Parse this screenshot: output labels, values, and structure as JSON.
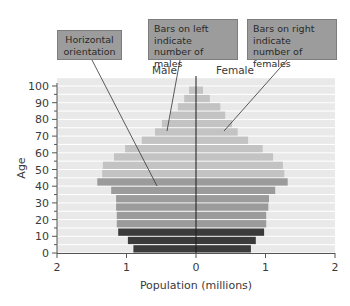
{
  "callouts": {
    "orientation": "Horizontal orientation",
    "males": "Bars on left indicate number of males",
    "females": "Bars on right indicate number of females"
  },
  "labels": {
    "male": "Male",
    "female": "Female"
  },
  "colors": {
    "band": "#e9e9e9",
    "light": "#c3c3c3",
    "medium": "#9b9b9b",
    "dark": "#3b3b3b",
    "box": "#9c9c9c"
  },
  "chart_data": {
    "type": "bar",
    "subtype": "population-pyramid",
    "orientation": "horizontal",
    "title": "",
    "xlabel": "Population (millions)",
    "ylabel": "Age",
    "x_ticks": [
      "2",
      "1",
      "0",
      "1",
      "2"
    ],
    "y_ticks": [
      "0",
      "10",
      "20",
      "30",
      "40",
      "50",
      "60",
      "70",
      "80",
      "90",
      "100"
    ],
    "xlim": [
      -2,
      2
    ],
    "ylim": [
      0,
      100
    ],
    "grid": false,
    "categories": [
      "0-4",
      "5-9",
      "10-14",
      "15-19",
      "20-24",
      "25-29",
      "30-34",
      "35-39",
      "40-44",
      "45-49",
      "50-54",
      "55-59",
      "60-64",
      "65-69",
      "70-74",
      "75-79",
      "80-84",
      "85-89",
      "90-94",
      "95-99",
      "100+"
    ],
    "series": [
      {
        "name": "Male",
        "side": "left",
        "values": [
          0.9,
          0.98,
          1.12,
          1.14,
          1.14,
          1.15,
          1.15,
          1.22,
          1.42,
          1.35,
          1.34,
          1.18,
          1.02,
          0.78,
          0.59,
          0.49,
          0.37,
          0.26,
          0.17,
          0.1,
          0.0
        ]
      },
      {
        "name": "Female",
        "side": "right",
        "values": [
          0.79,
          0.86,
          0.98,
          1.01,
          1.01,
          1.04,
          1.05,
          1.14,
          1.32,
          1.27,
          1.25,
          1.11,
          0.96,
          0.75,
          0.6,
          0.52,
          0.42,
          0.35,
          0.2,
          0.1,
          0.0
        ]
      }
    ],
    "shade_groups": [
      "dark",
      "dark",
      "dark",
      "medium",
      "medium",
      "medium",
      "medium",
      "medium",
      "medium",
      "light",
      "light",
      "light",
      "light",
      "light",
      "light",
      "light",
      "light",
      "light",
      "light",
      "light",
      "light"
    ],
    "annotations": [
      "Horizontal orientation",
      "Bars on left indicate number of males",
      "Bars on right indicate number of females"
    ]
  }
}
